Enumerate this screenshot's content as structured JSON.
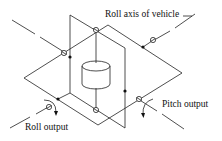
{
  "diagram": {
    "type": "gimbal-sketch",
    "labels": {
      "roll_axis": "Roll axis of vehicle",
      "pitch_output": "Pitch output",
      "roll_output": "Roll output"
    },
    "colors": {
      "line": "#222222",
      "background": "#ffffff"
    }
  }
}
